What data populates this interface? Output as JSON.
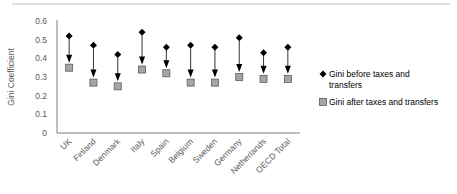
{
  "chart_data": {
    "type": "scatter",
    "title": "",
    "xlabel": "",
    "ylabel": "Gini Coefficient",
    "ylim": [
      0,
      0.6
    ],
    "yticks": [
      0,
      0.1,
      0.2,
      0.3,
      0.4,
      0.5,
      0.6
    ],
    "ytick_labels": [
      "0",
      "0.1",
      "0.2",
      "0.3",
      "0.4",
      "0.5",
      "0.6"
    ],
    "grid": false,
    "legend_position": "right",
    "categories": [
      "UK",
      "Finland",
      "Denmark",
      "Italy",
      "Spain",
      "Belgium",
      "Sweden",
      "Germany",
      "Netherlands",
      "OECD Total"
    ],
    "series": [
      {
        "name": "Gini before taxes and transfers",
        "marker": "diamond",
        "color": "#000000",
        "values": [
          0.52,
          0.47,
          0.42,
          0.54,
          0.46,
          0.47,
          0.46,
          0.51,
          0.43,
          0.46
        ]
      },
      {
        "name": "Gini after taxes and transfers",
        "marker": "square",
        "color": "#a6a6a6",
        "values": [
          0.35,
          0.27,
          0.25,
          0.34,
          0.32,
          0.27,
          0.27,
          0.3,
          0.29,
          0.29
        ]
      }
    ],
    "annotations": "Arrows point from before-value down to after-value for each country"
  },
  "legend": {
    "items": [
      {
        "line1": "Gini before taxes and",
        "line2": "transfers"
      },
      {
        "line1": "Gini after taxes and transfers",
        "line2": ""
      }
    ]
  },
  "colors": {
    "axis": "#7f7f7f",
    "text": "#595959",
    "arrow": "#000000",
    "square_fill": "#a6a6a6",
    "square_stroke": "#595959",
    "top_rule": "#bfbfbf"
  }
}
